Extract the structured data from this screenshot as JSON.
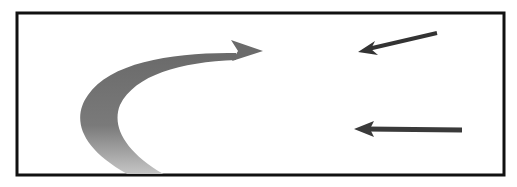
{
  "diagram": {
    "frame": {
      "x": 17,
      "y": 13,
      "width": 487,
      "height": 162,
      "stroke": "#111111",
      "stroke_width": 3
    },
    "curved_arrow": {
      "description": "gradient curved arrow sweeping from bottom-left up and pointing right",
      "gradient_start": "#6e6e6e",
      "gradient_end": "#d4d4d4",
      "tip": [
        263,
        51
      ]
    },
    "diagonal_arrow": {
      "description": "dark arrow pointing down-left",
      "color": "#333333",
      "from": [
        437,
        33
      ],
      "to": [
        358,
        52
      ]
    },
    "horizontal_arrow": {
      "description": "dark arrow pointing left",
      "color": "#3a3a3a",
      "from": [
        462,
        130
      ],
      "to": [
        354,
        129
      ]
    }
  }
}
